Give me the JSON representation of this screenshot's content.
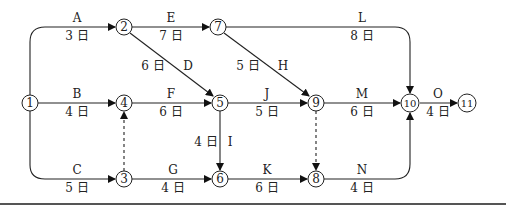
{
  "diagram": {
    "type": "activity-on-arrow network",
    "day_unit": "日",
    "nodes": [
      {
        "id": "1",
        "label": "1",
        "x": 30,
        "y": 103
      },
      {
        "id": "2",
        "label": "2",
        "x": 124,
        "y": 27
      },
      {
        "id": "3",
        "label": "3",
        "x": 124,
        "y": 179
      },
      {
        "id": "4",
        "label": "4",
        "x": 124,
        "y": 103
      },
      {
        "id": "5",
        "label": "5",
        "x": 220,
        "y": 103
      },
      {
        "id": "6",
        "label": "6",
        "x": 220,
        "y": 179
      },
      {
        "id": "7",
        "label": "7",
        "x": 218,
        "y": 27
      },
      {
        "id": "8",
        "label": "8",
        "x": 316,
        "y": 179
      },
      {
        "id": "9",
        "label": "9",
        "x": 316,
        "y": 103
      },
      {
        "id": "10",
        "label": "10",
        "x": 410,
        "y": 103
      },
      {
        "id": "11",
        "label": "11",
        "x": 467,
        "y": 103
      }
    ],
    "activities": [
      {
        "name": "A",
        "from": "1",
        "to": "2",
        "duration": "3 日"
      },
      {
        "name": "B",
        "from": "1",
        "to": "4",
        "duration": "4 日"
      },
      {
        "name": "C",
        "from": "1",
        "to": "3",
        "duration": "5 日"
      },
      {
        "name": "D",
        "from": "2",
        "to": "5",
        "duration": "6 日"
      },
      {
        "name": "E",
        "from": "2",
        "to": "7",
        "duration": "7 日"
      },
      {
        "name": "F",
        "from": "4",
        "to": "5",
        "duration": "6 日"
      },
      {
        "name": "G",
        "from": "3",
        "to": "6",
        "duration": "4 日"
      },
      {
        "name": "H",
        "from": "7",
        "to": "9",
        "duration": "5 日"
      },
      {
        "name": "I",
        "from": "5",
        "to": "6",
        "duration": "4 日"
      },
      {
        "name": "J",
        "from": "5",
        "to": "9",
        "duration": "5 日"
      },
      {
        "name": "K",
        "from": "6",
        "to": "8",
        "duration": "6 日"
      },
      {
        "name": "L",
        "from": "7",
        "to": "10",
        "duration": "8 日"
      },
      {
        "name": "M",
        "from": "9",
        "to": "10",
        "duration": "6 日"
      },
      {
        "name": "N",
        "from": "8",
        "to": "10",
        "duration": "4 日"
      },
      {
        "name": "O",
        "from": "10",
        "to": "11",
        "duration": "4 日"
      }
    ],
    "dummies": [
      {
        "from": "3",
        "to": "4"
      },
      {
        "from": "9",
        "to": "8"
      }
    ]
  }
}
